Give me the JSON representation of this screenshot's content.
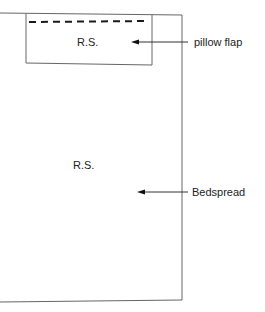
{
  "diagram": {
    "pillow_flap": {
      "side_label": "R.S.",
      "callout": "pillow flap"
    },
    "bedspread": {
      "side_label": "R.S.",
      "callout": "Bedspread"
    }
  },
  "colors": {
    "line": "#555555",
    "dash": "#1a1a1a",
    "text": "#222222"
  }
}
